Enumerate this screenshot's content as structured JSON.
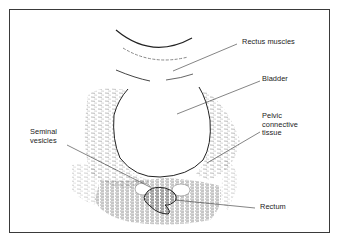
{
  "diagram": {
    "type": "ultrasound-anatomy-illustration",
    "labels": {
      "rectus_muscles": "Rectus muscles",
      "bladder": "Bladder",
      "pelvic_connective_tissue": "Pelvic\nconnective\ntissue",
      "seminal_vesicles": "Seminal\nvesicles",
      "rectum": "Rectum"
    },
    "colors": {
      "line": "#2a2a2a",
      "hatch": "#6a6a6a",
      "frame": "#3a3a3a",
      "background": "#ffffff"
    }
  }
}
